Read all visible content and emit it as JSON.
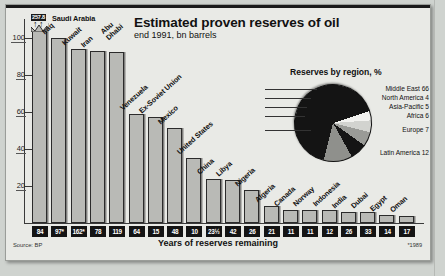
{
  "header": {
    "title": "Estimated proven reserves of oil",
    "subtitle": "end 1991, bn barrels"
  },
  "footer": {
    "source": "Source: BP",
    "xaxis_title": "Years of reserves remaining",
    "footnote": "*1989"
  },
  "pie": {
    "title": "Reserves by region, %"
  },
  "chart_data": [
    {
      "type": "bar",
      "title": "Estimated proven reserves of oil",
      "subtitle": "end 1991, bn barrels",
      "xlabel": "Years of reserves remaining",
      "ylabel": "bn barrels",
      "ylim": [
        0,
        110
      ],
      "yticks": [
        20,
        40,
        60,
        80,
        100
      ],
      "grid": false,
      "axis_break": true,
      "axis_break_value": "257.8",
      "source": "Source: BP",
      "footnote": "*1989",
      "categories": [
        "Saudi Arabia",
        "Iraq",
        "Kuwait",
        "Iran",
        "Abu Dhabi",
        "Venezuela",
        "Ex-Soviet Union",
        "Mexico",
        "United States",
        "China",
        "Libya",
        "Nigeria",
        "Algeria",
        "Canada",
        "Norway",
        "Indonesia",
        "India",
        "Dubai",
        "Egypt",
        "Oman"
      ],
      "values": [
        257.8,
        100,
        94,
        93,
        92,
        59,
        57,
        51,
        35,
        24,
        23,
        18,
        9,
        7,
        7,
        7,
        6,
        6,
        4.5,
        4
      ],
      "years_remaining": [
        "84",
        "97*",
        "162*",
        "78",
        "119",
        "64",
        "15",
        "48",
        "10",
        "23½",
        "42",
        "26",
        "21",
        "11",
        "11",
        "12",
        "26",
        "33",
        "14",
        "17"
      ],
      "years_label": "Years of reserves remaining"
    },
    {
      "type": "pie",
      "title": "Reserves by region, %",
      "labels": [
        "Middle East",
        "North America",
        "Asia-Pacific",
        "Africa",
        "Europe",
        "Latin America"
      ],
      "values": [
        66,
        4,
        5,
        6,
        7,
        12
      ],
      "legend": [
        "Middle East 66",
        "North America 4",
        "Asia-Pacific 5",
        "Africa 6",
        "Europe 7",
        "Latin America 12"
      ],
      "colors": [
        "#141414",
        "#f2f2ef",
        "#d2d3cf",
        "#9a9b97",
        "#141414",
        "#8f908c"
      ],
      "legend_position": "right-leader-lines"
    }
  ]
}
